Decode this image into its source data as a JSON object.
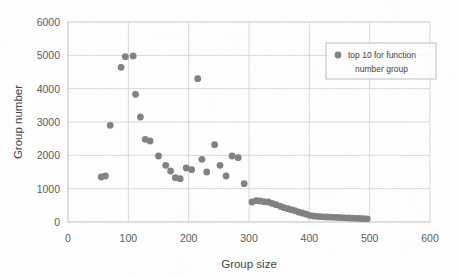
{
  "chart_data": {
    "type": "scatter",
    "title": "",
    "xlabel": "Group size",
    "ylabel": "Group number",
    "xlim": [
      0,
      600
    ],
    "ylim": [
      0,
      6000
    ],
    "xticks": [
      0,
      100,
      200,
      300,
      400,
      500,
      600
    ],
    "yticks": [
      0,
      1000,
      2000,
      3000,
      4000,
      5000,
      6000
    ],
    "grid": true,
    "legend_position": "top-right",
    "series": [
      {
        "name": "top 10 for function number group",
        "marker_color": "#808080",
        "points": [
          [
            55,
            1350
          ],
          [
            62,
            1380
          ],
          [
            70,
            2900
          ],
          [
            88,
            4640
          ],
          [
            95,
            4960
          ],
          [
            108,
            4980
          ],
          [
            112,
            3830
          ],
          [
            120,
            3150
          ],
          [
            128,
            2480
          ],
          [
            136,
            2430
          ],
          [
            150,
            1980
          ],
          [
            162,
            1700
          ],
          [
            170,
            1530
          ],
          [
            178,
            1330
          ],
          [
            186,
            1300
          ],
          [
            196,
            1620
          ],
          [
            205,
            1570
          ],
          [
            215,
            4300
          ],
          [
            222,
            1880
          ],
          [
            230,
            1500
          ],
          [
            243,
            2320
          ],
          [
            252,
            1700
          ],
          [
            262,
            1380
          ],
          [
            272,
            1980
          ],
          [
            282,
            1930
          ],
          [
            292,
            1150
          ],
          [
            305,
            600
          ],
          [
            312,
            640
          ],
          [
            318,
            630
          ],
          [
            325,
            610
          ],
          [
            332,
            600
          ],
          [
            338,
            560
          ],
          [
            345,
            520
          ],
          [
            352,
            470
          ],
          [
            358,
            430
          ],
          [
            364,
            400
          ],
          [
            370,
            370
          ],
          [
            376,
            340
          ],
          [
            382,
            300
          ],
          [
            388,
            270
          ],
          [
            394,
            240
          ],
          [
            400,
            200
          ],
          [
            406,
            180
          ],
          [
            412,
            170
          ],
          [
            418,
            160
          ],
          [
            424,
            155
          ],
          [
            430,
            150
          ],
          [
            436,
            145
          ],
          [
            442,
            140
          ],
          [
            448,
            135
          ],
          [
            454,
            130
          ],
          [
            460,
            125
          ],
          [
            466,
            120
          ],
          [
            472,
            115
          ],
          [
            478,
            110
          ],
          [
            484,
            105
          ],
          [
            490,
            100
          ],
          [
            496,
            95
          ]
        ]
      }
    ],
    "legend": [
      {
        "line1": "top 10 for function",
        "line2": "number group"
      }
    ]
  }
}
